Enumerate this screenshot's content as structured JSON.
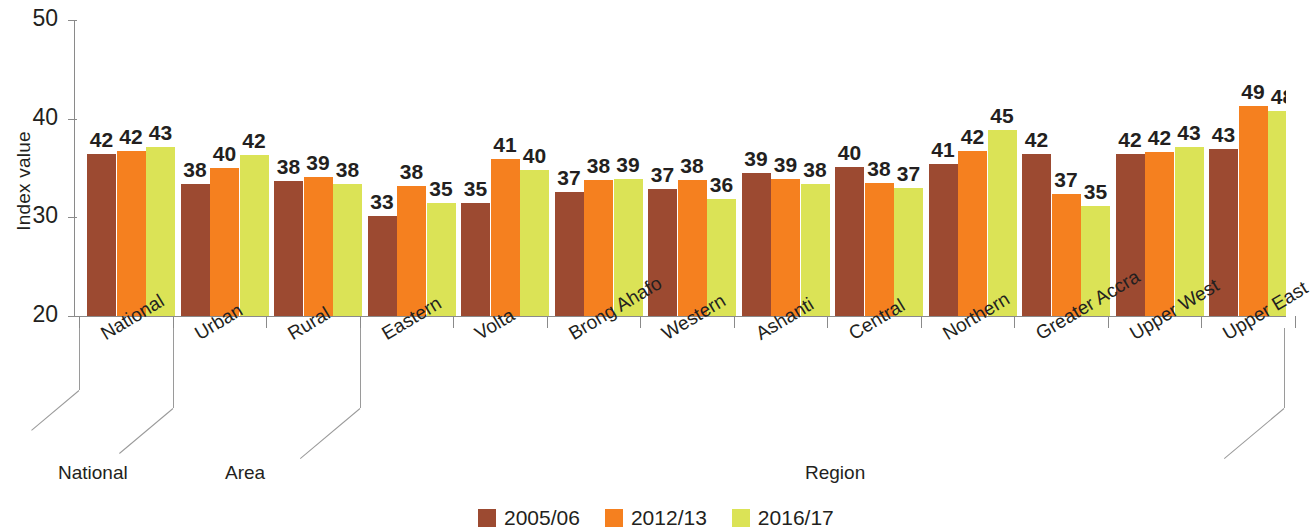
{
  "chart_data": {
    "type": "bar",
    "title": "",
    "xlabel": "",
    "ylabel": "Index value",
    "ylim": [
      20,
      50
    ],
    "yticks": [
      20,
      30,
      40,
      50
    ],
    "grid": false,
    "legend_position": "bottom-center",
    "categories": [
      "National",
      "Urban",
      "Rural",
      "Eastern",
      "Volta",
      "Brong Ahafo",
      "Western",
      "Ashanti",
      "Central",
      "Northern",
      "Greater Accra",
      "Upper West",
      "Upper East"
    ],
    "series": [
      {
        "name": "2005/06",
        "color": "#9c4a31",
        "values": [
          42,
          38,
          38,
          33,
          35,
          37,
          37,
          39,
          40,
          41,
          42,
          42,
          43
        ],
        "plotted": [
          36.4,
          33.4,
          33.7,
          30.1,
          31.5,
          32.6,
          32.9,
          34.5,
          35.1,
          35.4,
          36.4,
          36.4,
          36.9
        ]
      },
      {
        "name": "2012/13",
        "color": "#f5801f",
        "values": [
          42,
          40,
          39,
          38,
          41,
          38,
          38,
          39,
          38,
          42,
          37,
          42,
          49
        ],
        "plotted": [
          36.7,
          35.0,
          34.1,
          33.2,
          35.9,
          33.8,
          33.8,
          33.9,
          33.5,
          36.7,
          32.4,
          36.6,
          41.3
        ]
      },
      {
        "name": "2016/17",
        "color": "#dbe356",
        "values": [
          43,
          42,
          38,
          35,
          40,
          39,
          36,
          38,
          37,
          45,
          35,
          43,
          48
        ],
        "plotted": [
          37.1,
          36.3,
          33.4,
          31.5,
          34.8,
          33.9,
          31.9,
          33.4,
          33.0,
          38.9,
          31.2,
          37.1,
          40.8
        ]
      }
    ],
    "axis_groups": [
      {
        "label": "National",
        "categories": [
          "National"
        ]
      },
      {
        "label": "Area",
        "categories": [
          "Urban",
          "Rural"
        ]
      },
      {
        "label": "Region",
        "categories": [
          "Eastern",
          "Volta",
          "Brong Ahafo",
          "Western",
          "Ashanti",
          "Central",
          "Northern",
          "Greater Accra",
          "Upper West",
          "Upper East"
        ]
      }
    ]
  },
  "legend": {
    "items": [
      {
        "label": "2005/06",
        "color": "#9c4a31"
      },
      {
        "label": "2012/13",
        "color": "#f5801f"
      },
      {
        "label": "2016/17",
        "color": "#dbe356"
      }
    ]
  }
}
